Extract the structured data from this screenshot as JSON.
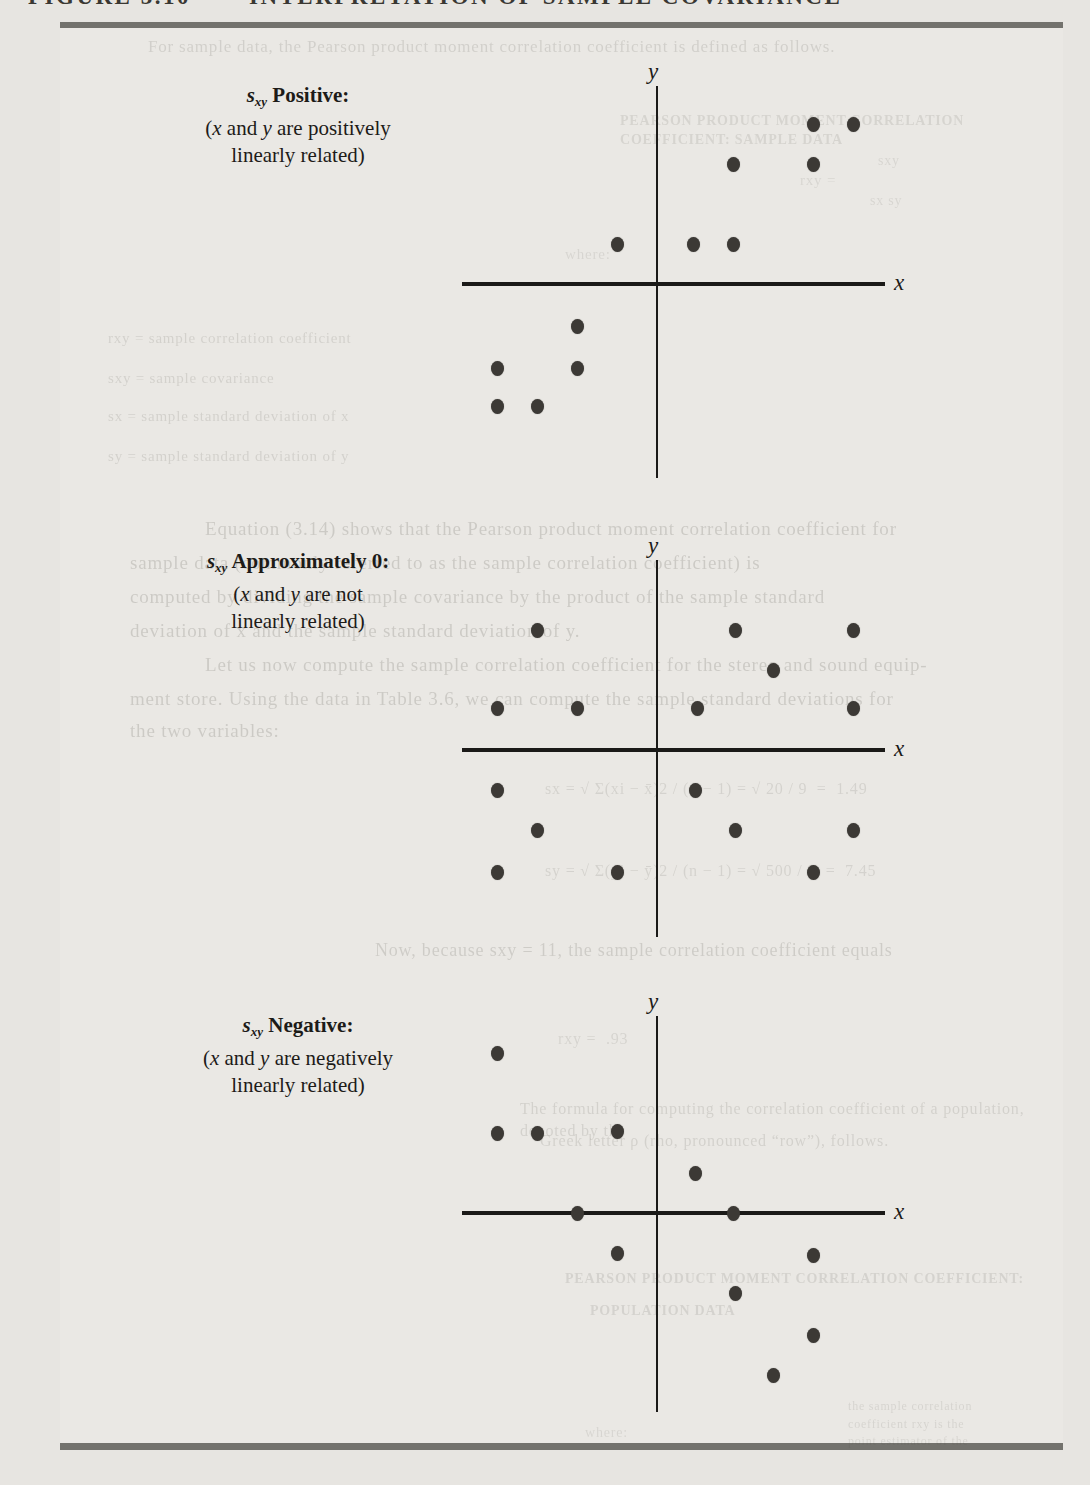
{
  "page": {
    "header_left": "FIGURE 3.10",
    "header_right": "INTERPRETATION OF SAMPLE COVARIANCE",
    "paper_color": "#e7e5e1",
    "panel_color": "#eae8e4",
    "rule_color": "#73726d",
    "dot_color": "#3c3935",
    "axis_color": "#1b1a18"
  },
  "chart_data": [
    {
      "type": "scatter",
      "label_s": "s",
      "label_sub": "xy",
      "label_kind": "Positive:",
      "cap_pre": "(",
      "cap_x": "x",
      "cap_and": " and ",
      "cap_y": "y",
      "cap_tail": " are positively",
      "cap_line2": "linearly related)",
      "xlabel": "x",
      "ylabel": "y",
      "xlim": [
        -5,
        5.5
      ],
      "ylim": [
        -5,
        5
      ],
      "grid": false,
      "legend": "none",
      "points": [
        [
          3.9,
          4
        ],
        [
          4.9,
          4
        ],
        [
          1.9,
          3
        ],
        [
          3.9,
          3
        ],
        [
          -1,
          1
        ],
        [
          0.9,
          1
        ],
        [
          1.9,
          1
        ],
        [
          -2,
          -1.05
        ],
        [
          -4,
          -2.1
        ],
        [
          -2,
          -2.1
        ],
        [
          -4,
          -3.05
        ],
        [
          -3,
          -3.05
        ]
      ],
      "layout": {
        "origin_x": 657,
        "origin_y": 284,
        "scale": 40,
        "x_left": 462,
        "x_right": 885,
        "y_top": 86,
        "y_bottom": 478,
        "label_left": 118,
        "label_top": 82
      }
    },
    {
      "type": "scatter",
      "label_s": "s",
      "label_sub": "xy",
      "label_kind": "Approximately 0:",
      "cap_pre": "(",
      "cap_x": "x",
      "cap_and": " and ",
      "cap_y": "y",
      "cap_tail": " are not",
      "cap_line2": "linearly related)",
      "xlabel": "x",
      "ylabel": "y",
      "xlim": [
        -5,
        5.5
      ],
      "ylim": [
        -5,
        5
      ],
      "grid": false,
      "legend": "none",
      "points": [
        [
          -3,
          3
        ],
        [
          1.95,
          3
        ],
        [
          4.9,
          3
        ],
        [
          2.9,
          2
        ],
        [
          -4,
          1.05
        ],
        [
          -2,
          1.05
        ],
        [
          1,
          1.05
        ],
        [
          4.9,
          1.05
        ],
        [
          -4,
          -1
        ],
        [
          0.95,
          -1
        ],
        [
          -3,
          -2
        ],
        [
          1.95,
          -2
        ],
        [
          4.9,
          -2
        ],
        [
          -4,
          -3.05
        ],
        [
          -1,
          -3.05
        ],
        [
          3.9,
          -3.05
        ]
      ],
      "layout": {
        "origin_x": 657,
        "origin_y": 750,
        "scale": 40,
        "x_left": 462,
        "x_right": 885,
        "y_top": 560,
        "y_bottom": 937,
        "label_left": 118,
        "label_top": 548
      }
    },
    {
      "type": "scatter",
      "label_s": "s",
      "label_sub": "xy",
      "label_kind": "Negative:",
      "cap_pre": "(",
      "cap_x": "x",
      "cap_and": " and ",
      "cap_y": "y",
      "cap_tail": " are negatively",
      "cap_line2": "linearly related)",
      "xlabel": "x",
      "ylabel": "y",
      "xlim": [
        -5,
        5.5
      ],
      "ylim": [
        -5.2,
        5
      ],
      "grid": false,
      "legend": "none",
      "points": [
        [
          -4,
          4
        ],
        [
          -4,
          2
        ],
        [
          -3,
          2
        ],
        [
          -1,
          2.05
        ],
        [
          0.95,
          1
        ],
        [
          -2,
          0
        ],
        [
          1.9,
          0
        ],
        [
          -1,
          -1
        ],
        [
          3.9,
          -1.05
        ],
        [
          1.95,
          -2
        ],
        [
          3.9,
          -3.05
        ],
        [
          2.9,
          -4.05
        ]
      ],
      "layout": {
        "origin_x": 657,
        "origin_y": 1213,
        "scale": 40,
        "x_left": 462,
        "x_right": 885,
        "y_top": 1016,
        "y_bottom": 1412,
        "label_left": 118,
        "label_top": 1012
      }
    }
  ],
  "ghosts": [
    {
      "text": "For sample data, the Pearson product moment correlation coefficient is defined as follows.",
      "x": 148,
      "y": 36,
      "size": 17,
      "opacity": 0.15,
      "width": 930
    },
    {
      "text": "PEARSON PRODUCT MOMENT CORRELATION COEFFICIENT: SAMPLE DATA",
      "x": 620,
      "y": 112,
      "size": 14,
      "opacity": 0.12,
      "width": 450,
      "bold": true
    },
    {
      "text": "rxy =",
      "x": 800,
      "y": 170,
      "size": 15,
      "opacity": 0.11
    },
    {
      "text": "sxy",
      "x": 878,
      "y": 152,
      "size": 14,
      "opacity": 0.11
    },
    {
      "text": "sx sy",
      "x": 870,
      "y": 192,
      "size": 14,
      "opacity": 0.11
    },
    {
      "text": "where:",
      "x": 565,
      "y": 244,
      "size": 15,
      "opacity": 0.11
    },
    {
      "text": "rxy = sample correlation coefficient",
      "x": 108,
      "y": 328,
      "size": 15,
      "opacity": 0.14,
      "width": 350
    },
    {
      "text": "sxy = sample covariance",
      "x": 108,
      "y": 368,
      "size": 15,
      "opacity": 0.14,
      "width": 350
    },
    {
      "text": "sx = sample standard deviation of x",
      "x": 108,
      "y": 406,
      "size": 15,
      "opacity": 0.14,
      "width": 350
    },
    {
      "text": "sy = sample standard deviation of y",
      "x": 108,
      "y": 446,
      "size": 15,
      "opacity": 0.14,
      "width": 350
    },
    {
      "text": "Equation (3.14) shows that the Pearson product moment correlation coefficient for",
      "x": 205,
      "y": 516,
      "size": 19,
      "opacity": 0.18,
      "width": 855
    },
    {
      "text": "sample data (commonly referred to as the sample correlation coefficient) is",
      "x": 130,
      "y": 550,
      "size": 19,
      "opacity": 0.18,
      "width": 930
    },
    {
      "text": "computed by dividing the sample covariance by the product of the sample standard",
      "x": 130,
      "y": 584,
      "size": 19,
      "opacity": 0.18,
      "width": 930
    },
    {
      "text": "deviation of x and the sample standard deviation of y.",
      "x": 130,
      "y": 618,
      "size": 19,
      "opacity": 0.18,
      "width": 930
    },
    {
      "text": "Let us now compute the sample correlation coefficient for the stereo and sound equip-",
      "x": 205,
      "y": 652,
      "size": 19,
      "opacity": 0.18,
      "width": 855
    },
    {
      "text": "ment store. Using the data in Table 3.6, we can compute the sample standard deviations for",
      "x": 130,
      "y": 686,
      "size": 19,
      "opacity": 0.18,
      "width": 935
    },
    {
      "text": "the two variables:",
      "x": 130,
      "y": 718,
      "size": 19,
      "opacity": 0.18
    },
    {
      "text": "sx = √ Σ(xi − x̄)2 / (n − 1) = √ 20 / 9  =  1.49",
      "x": 545,
      "y": 778,
      "size": 16,
      "opacity": 0.13,
      "width": 520
    },
    {
      "text": "sy = √ Σ(yi − ȳ)2 / (n − 1) = √ 500 / 9  =  7.45",
      "x": 545,
      "y": 860,
      "size": 16,
      "opacity": 0.13,
      "width": 520
    },
    {
      "text": "Now, because sxy = 11, the sample correlation coefficient equals",
      "x": 375,
      "y": 938,
      "size": 18,
      "opacity": 0.17,
      "width": 690
    },
    {
      "text": "rxy =  .93",
      "x": 558,
      "y": 1028,
      "size": 16,
      "opacity": 0.12
    },
    {
      "text": "The formula for computing the correlation coefficient of a population, denoted by the",
      "x": 520,
      "y": 1098,
      "size": 16,
      "opacity": 0.14,
      "width": 545
    },
    {
      "text": "Greek letter ρ (rho, pronounced “row”), follows.",
      "x": 540,
      "y": 1130,
      "size": 16,
      "opacity": 0.14,
      "width": 500
    },
    {
      "text": "PEARSON PRODUCT MOMENT CORRELATION COEFFICIENT:",
      "x": 565,
      "y": 1270,
      "size": 14,
      "opacity": 0.13,
      "width": 480,
      "bold": true
    },
    {
      "text": "POPULATION DATA",
      "x": 590,
      "y": 1302,
      "size": 14,
      "opacity": 0.13,
      "bold": true
    },
    {
      "text": "the sample correlation",
      "x": 848,
      "y": 1398,
      "size": 12,
      "opacity": 0.12,
      "width": 160
    },
    {
      "text": "coefficient rxy is the",
      "x": 848,
      "y": 1416,
      "size": 12,
      "opacity": 0.12,
      "width": 160
    },
    {
      "text": "point estimator of the",
      "x": 848,
      "y": 1433,
      "size": 12,
      "opacity": 0.11,
      "width": 160
    },
    {
      "text": "where:",
      "x": 585,
      "y": 1424,
      "size": 14,
      "opacity": 0.11
    }
  ]
}
